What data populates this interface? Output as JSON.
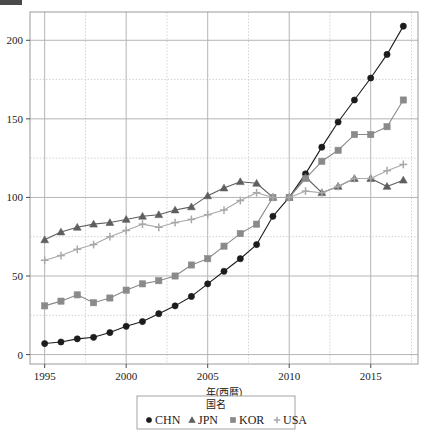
{
  "figure": {
    "width": 429,
    "height": 433,
    "background": "#ffffff"
  },
  "chart_data": {
    "type": "line",
    "title": "",
    "xlabel": "年(西暦)",
    "ylabel": "",
    "x": [
      1995,
      1996,
      1997,
      1998,
      1999,
      2000,
      2001,
      2002,
      2003,
      2004,
      2005,
      2006,
      2007,
      2008,
      2009,
      2010,
      2011,
      2012,
      2013,
      2014,
      2015,
      2016,
      2017
    ],
    "xlim": [
      1994.1,
      2017.9
    ],
    "ylim": [
      -6,
      218
    ],
    "xticks": [
      1995,
      2000,
      2005,
      2010,
      2015
    ],
    "xtick_labels": [
      "1995",
      "2000",
      "2005",
      "2010",
      "2015"
    ],
    "yticks": [
      0,
      50,
      100,
      150,
      200
    ],
    "ytick_labels": [
      "0",
      "50",
      "100",
      "150",
      "200"
    ],
    "y_minor_gridlines": [
      25,
      75,
      125,
      175
    ],
    "x_minor_gridlines": [
      1997.5,
      2002.5,
      2007.5,
      2012.5,
      2017.5
    ],
    "grid": true,
    "grid_major_color": "#b5b5b5",
    "grid_minor_color": "#c9c9c9",
    "grid_minor_style": "dotted",
    "legend_position": "below-center",
    "legend_title": "国名",
    "series": [
      {
        "name": "CHN",
        "marker": "circle",
        "color": "#1c1c1c",
        "values": [
          7,
          8,
          10,
          11,
          14,
          18,
          21,
          26,
          31,
          37,
          45,
          53,
          61,
          70,
          88,
          100,
          115,
          132,
          148,
          162,
          176,
          191,
          209
        ]
      },
      {
        "name": "JPN",
        "marker": "triangle",
        "color": "#5e5e5e",
        "values": [
          73,
          78,
          81,
          83,
          84,
          86,
          88,
          89,
          92,
          94,
          101,
          106,
          110,
          109,
          100,
          100,
          113,
          103,
          107,
          112,
          112,
          107,
          111
        ]
      },
      {
        "name": "KOR",
        "marker": "square",
        "color": "#8a8a8a",
        "values": [
          31,
          34,
          38,
          33,
          36,
          41,
          45,
          47,
          50,
          57,
          61,
          69,
          77,
          83,
          100,
          100,
          112,
          123,
          130,
          140,
          140,
          145,
          162
        ]
      },
      {
        "name": "USA",
        "marker": "plus",
        "color": "#a8a8a8",
        "values": [
          60,
          63,
          67,
          70,
          75,
          79,
          83,
          81,
          84,
          86,
          89,
          92,
          98,
          103,
          100,
          100,
          104,
          103,
          107,
          112,
          112,
          117,
          121
        ]
      }
    ]
  },
  "legend": {
    "title": "国名",
    "items": [
      {
        "label": "CHN",
        "marker": "circle-marker"
      },
      {
        "label": "JPN",
        "marker": "triangle-marker"
      },
      {
        "label": "KOR",
        "marker": "square-marker"
      },
      {
        "label": "USA",
        "marker": "plus-marker"
      }
    ]
  },
  "axes": {
    "x_axis_title": "年(西暦)",
    "y_axis_title": ""
  }
}
